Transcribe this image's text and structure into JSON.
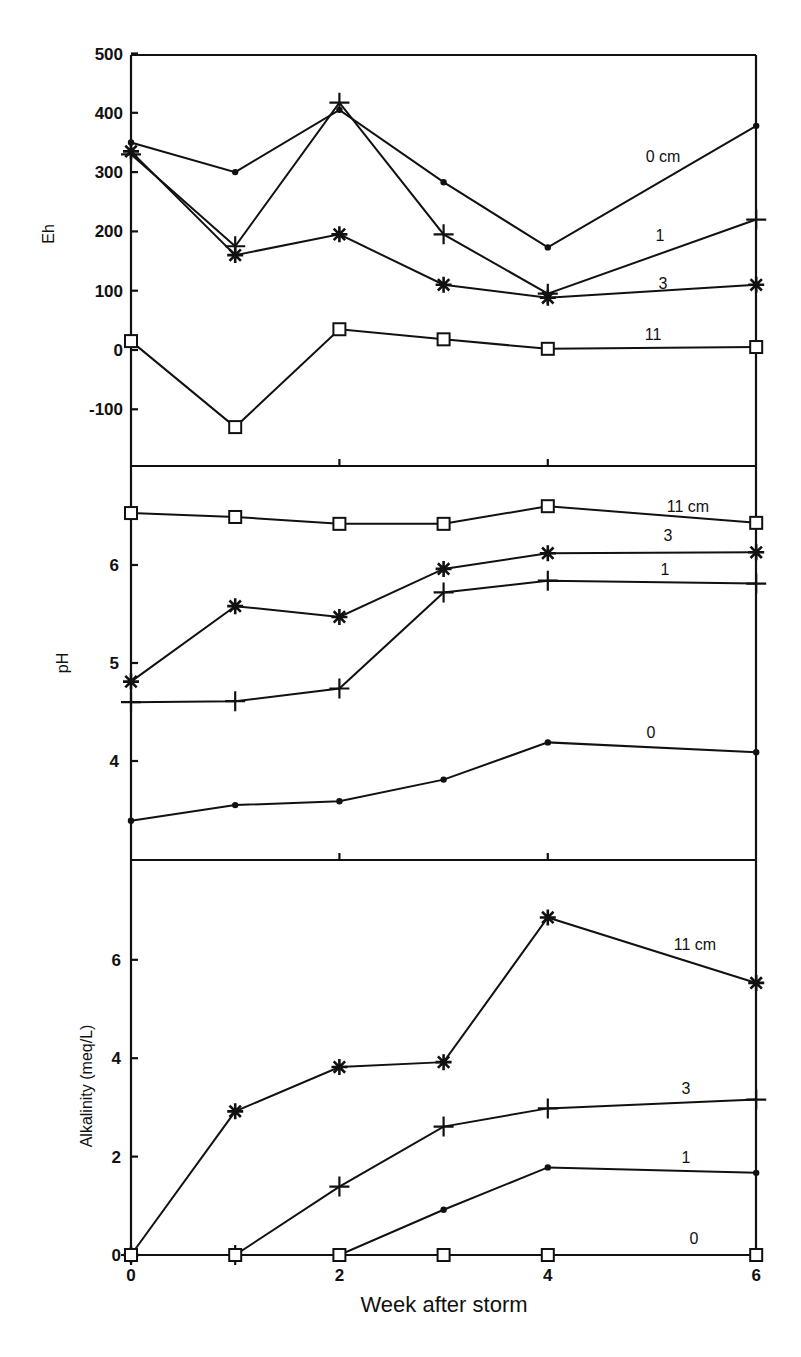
{
  "chart_data": [
    {
      "type": "line",
      "panel": "top",
      "ylabel": "Eh",
      "xlabel": "Week after storm",
      "x": [
        0,
        1,
        2,
        3,
        4,
        6
      ],
      "xlim": [
        0,
        6
      ],
      "ylim": [
        -195,
        500
      ],
      "yticks": [
        -100,
        0,
        100,
        200,
        300,
        400,
        500
      ],
      "grid": false,
      "legend": "inline labels at right",
      "series": [
        {
          "name": "0cm",
          "marker": "dot",
          "label": "0 cm",
          "values": [
            350,
            300,
            405,
            283,
            173,
            378
          ]
        },
        {
          "name": "1cm",
          "marker": "plus",
          "label": "1",
          "values": [
            330,
            175,
            417,
            195,
            95,
            220
          ]
        },
        {
          "name": "3cm",
          "marker": "asterisk",
          "label": "3",
          "values": [
            335,
            160,
            195,
            110,
            88,
            110
          ]
        },
        {
          "name": "11cm",
          "marker": "square",
          "label": "11",
          "values": [
            15,
            -130,
            35,
            18,
            2,
            5
          ]
        }
      ]
    },
    {
      "type": "line",
      "panel": "middle",
      "ylabel": "pH",
      "xlabel": "Week after storm",
      "x": [
        0,
        1,
        2,
        3,
        4,
        6
      ],
      "xlim": [
        0,
        6
      ],
      "ylim": [
        3.03,
        7.0
      ],
      "yticks": [
        4,
        5,
        6
      ],
      "grid": false,
      "legend": "inline labels at right",
      "series": [
        {
          "name": "11cm",
          "marker": "square",
          "label": "11 cm",
          "values": [
            6.53,
            6.49,
            6.42,
            6.42,
            6.6,
            6.43
          ]
        },
        {
          "name": "3cm",
          "marker": "asterisk",
          "label": "3",
          "values": [
            4.81,
            5.58,
            5.47,
            5.96,
            6.12,
            6.13
          ]
        },
        {
          "name": "1cm",
          "marker": "plus",
          "label": "1",
          "values": [
            4.6,
            4.61,
            4.74,
            5.72,
            5.84,
            5.81
          ]
        },
        {
          "name": "0cm",
          "marker": "dot",
          "label": "0",
          "values": [
            3.39,
            3.55,
            3.59,
            3.81,
            4.19,
            4.09
          ]
        }
      ]
    },
    {
      "type": "line",
      "panel": "bottom",
      "ylabel": "Alkalinity (meq/L)",
      "xlabel": "Week after storm",
      "x": [
        0,
        1,
        2,
        3,
        4,
        6
      ],
      "xlim": [
        0,
        6
      ],
      "ylim": [
        0,
        8
      ],
      "yticks": [
        0,
        2,
        4,
        6
      ],
      "xticks": [
        0,
        2,
        4,
        6
      ],
      "grid": false,
      "legend": "inline labels at right",
      "series": [
        {
          "name": "11cm",
          "marker": "asterisk",
          "label": "11 cm",
          "values": [
            0,
            2.92,
            3.82,
            3.92,
            6.86,
            5.53
          ]
        },
        {
          "name": "3cm",
          "marker": "plus",
          "label": "3",
          "values": [
            0,
            0,
            1.39,
            2.61,
            2.98,
            3.16
          ]
        },
        {
          "name": "1cm",
          "marker": "dot",
          "label": "1",
          "values": [
            0,
            0,
            0,
            0.92,
            1.78,
            1.67
          ]
        },
        {
          "name": "0cm",
          "marker": "square",
          "label": "0",
          "values": [
            0,
            0,
            0,
            0,
            0,
            0
          ]
        }
      ]
    }
  ],
  "labels": {
    "eh_axis": "Eh",
    "ph_axis": "pH",
    "alk_axis": "Alkalinity (meq/L)",
    "x_axis": "Week after storm",
    "eh_ticks": [
      "500",
      "400",
      "300",
      "200",
      "100",
      "0",
      "-100"
    ],
    "ph_ticks": [
      "6",
      "5",
      "4"
    ],
    "alk_ticks": [
      "6",
      "4",
      "2",
      "0"
    ],
    "x_ticks": [
      "0",
      "2",
      "4",
      "6"
    ]
  }
}
